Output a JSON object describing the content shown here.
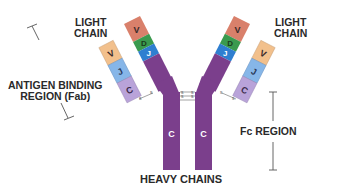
{
  "labels": {
    "light_chain_left": [
      "LIGHT",
      "CHAIN"
    ],
    "light_chain_right": [
      "LIGHT",
      "CHAIN"
    ],
    "fab": [
      "ANTIGEN BINDING",
      "REGION (Fab)"
    ],
    "fc": "Fc REGION",
    "heavy": "HEAVY CHAINS"
  },
  "segments": {
    "heavy": [
      "V",
      "D",
      "J",
      "C"
    ],
    "light": [
      "V",
      "J",
      "C"
    ]
  },
  "bonds": {
    "disulfide": "S–S"
  },
  "colors": {
    "heavy_v": "#d9806b",
    "heavy_d": "#3a9a4e",
    "heavy_j": "#2f7fd0",
    "heavy_c": "#7b3f8c",
    "light_v": "#f2c08c",
    "light_j": "#86b6e8",
    "light_c": "#b9a3d9",
    "text": "#2a2a2a"
  }
}
